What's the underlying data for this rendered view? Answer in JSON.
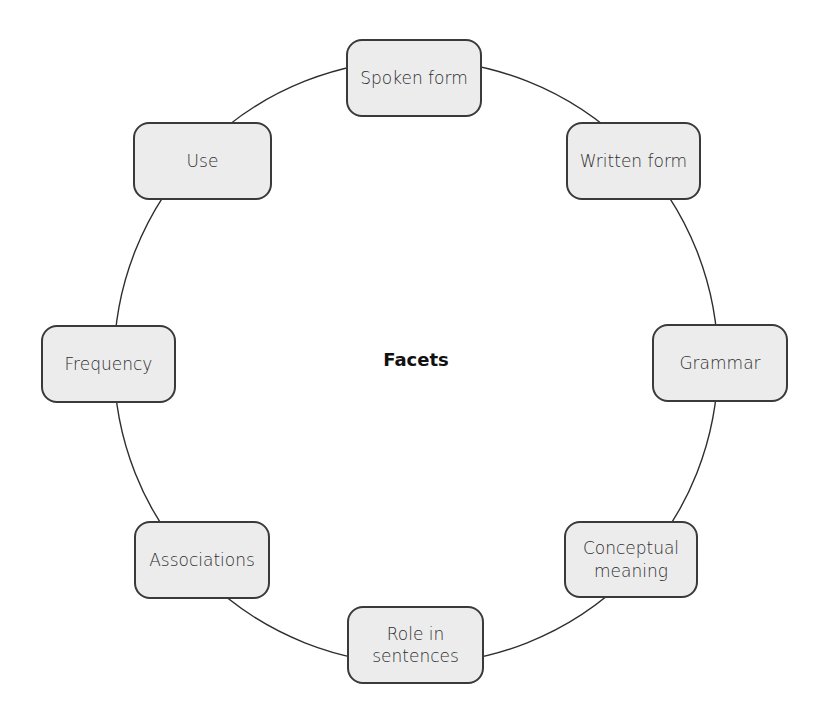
{
  "diagram": {
    "center_label": "Facets",
    "ring": {
      "cx": 416,
      "cy": 362,
      "rx": 302,
      "ry": 302,
      "stroke": "#2e2e2e"
    },
    "node_fill": "#ececec",
    "node_border": "#3a3a3a",
    "nodes": [
      {
        "label": "Spoken form",
        "x": 346,
        "y": 39,
        "w": 136,
        "h": 78
      },
      {
        "label": "Written form",
        "x": 566,
        "y": 122,
        "w": 135,
        "h": 78
      },
      {
        "label": "Grammar",
        "x": 652,
        "y": 324,
        "w": 136,
        "h": 78
      },
      {
        "label": "Conceptual\nmeaning",
        "x": 564,
        "y": 521,
        "w": 134,
        "h": 77
      },
      {
        "label": "Role in\nsentences",
        "x": 347,
        "y": 606,
        "w": 137,
        "h": 78
      },
      {
        "label": "Associations",
        "x": 134,
        "y": 521,
        "w": 136,
        "h": 78
      },
      {
        "label": "Frequency",
        "x": 41,
        "y": 325,
        "w": 135,
        "h": 78
      },
      {
        "label": "Use",
        "x": 133,
        "y": 122,
        "w": 139,
        "h": 78
      }
    ]
  }
}
